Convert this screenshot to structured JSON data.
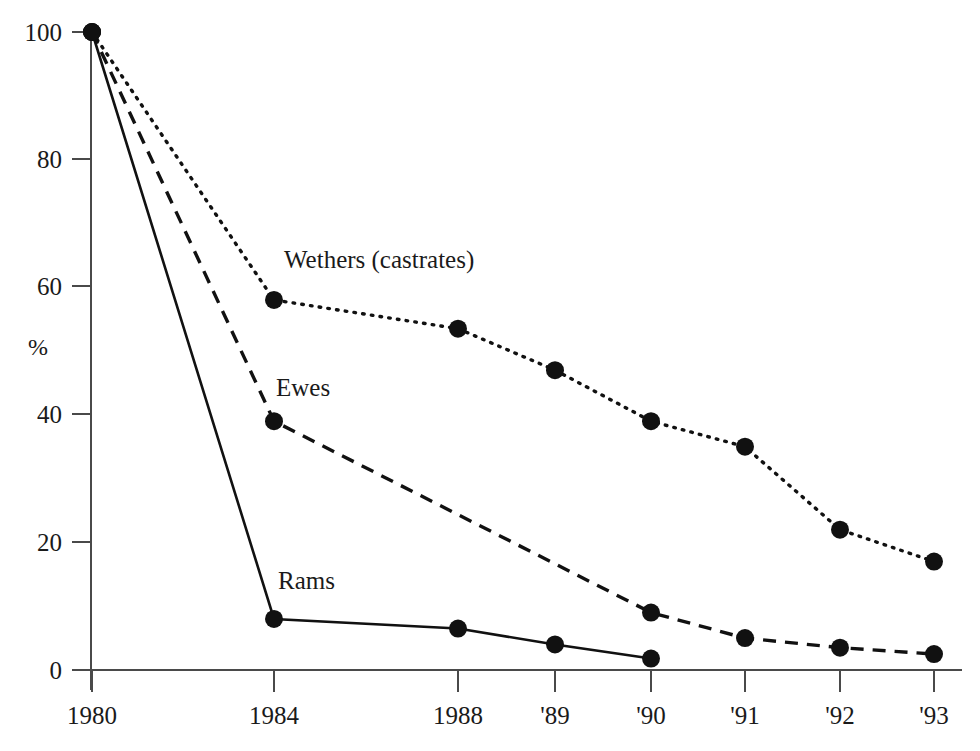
{
  "chart_data": {
    "type": "line",
    "title": "",
    "subtitle": "",
    "xlabel": "",
    "ylabel": "%",
    "categories": [
      "1980",
      "1984",
      "1988",
      "'89",
      "'90",
      "'91",
      "'92",
      "'93"
    ],
    "x_tick_labels": [
      "1980",
      "1984",
      "1988",
      "'89",
      "'90",
      "'91",
      "'92",
      "'93"
    ],
    "y_tick_labels": [
      "0",
      "20",
      "40",
      "60",
      "80",
      "100"
    ],
    "y_ticks": [
      0,
      20,
      40,
      60,
      80,
      100
    ],
    "ylim": [
      0,
      100
    ],
    "grid": false,
    "legend_position": "inline-annotations",
    "series": [
      {
        "name": "Wethers (castrates)",
        "label": "Wethers (castrates)",
        "style": "dotted",
        "x": [
          "1980",
          "1984",
          "1988",
          "'89",
          "'90",
          "'91",
          "'92",
          "'93"
        ],
        "values": [
          100,
          58,
          53.5,
          47,
          39,
          35,
          22,
          17
        ]
      },
      {
        "name": "Ewes",
        "label": "Ewes",
        "style": "dashed",
        "x": [
          "1980",
          "1984",
          "'90",
          "'91",
          "'92",
          "'93"
        ],
        "values": [
          100,
          39,
          9,
          5,
          3.5,
          2.5
        ]
      },
      {
        "name": "Rams",
        "label": "Rams",
        "style": "solid",
        "x": [
          "1980",
          "1984",
          "1988",
          "'89",
          "'90"
        ],
        "values": [
          100,
          8,
          6.5,
          4,
          1.8
        ]
      }
    ],
    "annotations": [
      {
        "text": "Wethers (castrates)",
        "series": "Wethers (castrates)"
      },
      {
        "text": "Ewes",
        "series": "Ewes"
      },
      {
        "text": "Rams",
        "series": "Rams"
      }
    ],
    "colors": {
      "background": "#ffffff",
      "ink": "#111111",
      "axis": "#4a4a4a"
    }
  }
}
